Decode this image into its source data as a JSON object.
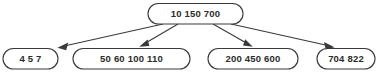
{
  "diagram": {
    "type": "b-tree",
    "title": "",
    "background_color": "#ffffff",
    "node_fill": "#ffffff",
    "node_stroke": "#3a3a3a",
    "text_color": "#2b2b2b",
    "root": {
      "id": "root-node",
      "keys": [
        "10",
        "150",
        "700"
      ],
      "keys_joined": "10   150   700"
    },
    "leaves": [
      {
        "id": "leaf-node-1",
        "keys": [
          "4",
          "5",
          "7"
        ],
        "keys_joined": "4   5   7"
      },
      {
        "id": "leaf-node-2",
        "keys": [
          "50",
          "60",
          "100",
          "110"
        ],
        "keys_joined": "50   60   100   110"
      },
      {
        "id": "leaf-node-3",
        "keys": [
          "200",
          "450",
          "600"
        ],
        "keys_joined": "200   450   600"
      },
      {
        "id": "leaf-node-4",
        "keys": [
          "704",
          "822"
        ],
        "keys_joined": "704   822"
      }
    ],
    "edges": [
      {
        "id": "edge-root-to-leaf-1",
        "from": "root-node",
        "to": "leaf-node-1"
      },
      {
        "id": "edge-root-to-leaf-2",
        "from": "root-node",
        "to": "leaf-node-2"
      },
      {
        "id": "edge-root-to-leaf-3",
        "from": "root-node",
        "to": "leaf-node-3"
      },
      {
        "id": "edge-root-to-leaf-4",
        "from": "root-node",
        "to": "leaf-node-4"
      }
    ]
  }
}
